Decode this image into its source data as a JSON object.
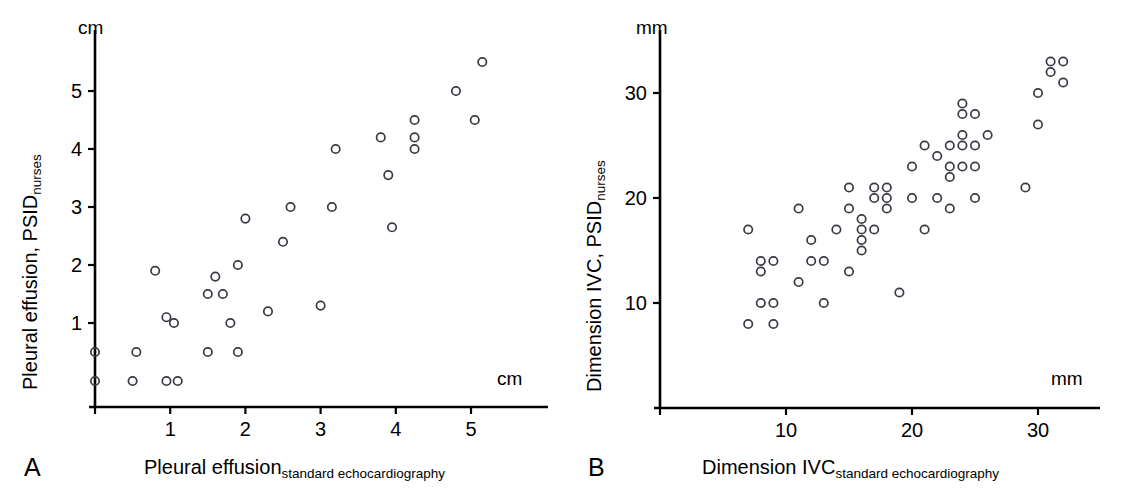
{
  "figure": {
    "background": "#ffffff",
    "marker_color": "#3a3a45",
    "axis_color": "#000000"
  },
  "panels": [
    {
      "letter": "A",
      "x_axis_unit": "cm",
      "y_axis_unit": "cm",
      "x_label_main": "Pleural effusion",
      "x_label_sub": "standard echocardiography",
      "y_label_main": "Pleural effusion, PSID",
      "y_label_sub": "nurses",
      "x_ticks": [
        1,
        2,
        3,
        4,
        5
      ],
      "y_ticks": [
        1,
        2,
        3,
        4,
        5
      ]
    },
    {
      "letter": "B",
      "x_axis_unit": "mm",
      "y_axis_unit": "mm",
      "x_label_main": "Dimension IVC",
      "x_label_sub": "standard echocardiography",
      "y_label_main": "Dimension IVC, PSID",
      "y_label_sub": "nurses",
      "x_ticks": [
        10,
        20,
        30
      ],
      "y_ticks": [
        10,
        20,
        30
      ]
    }
  ],
  "chart_data": [
    {
      "type": "scatter",
      "panel": "A",
      "title": "",
      "xlabel": "Pleural effusion (standard echocardiography)",
      "ylabel": "Pleural effusion, PSID (nurses)",
      "xunit": "cm",
      "yunit": "cm",
      "xlim": [
        0,
        5.8
      ],
      "ylim": [
        0,
        5.8
      ],
      "xticks": [
        1,
        2,
        3,
        4,
        5
      ],
      "yticks": [
        1,
        2,
        3,
        4,
        5
      ],
      "grid": false,
      "legend": "none",
      "n_points": 38,
      "points": [
        [
          0.0,
          0.0
        ],
        [
          0.0,
          0.5
        ],
        [
          0.5,
          0.0
        ],
        [
          0.95,
          0.0
        ],
        [
          1.1,
          0.0
        ],
        [
          0.55,
          0.5
        ],
        [
          1.5,
          0.5
        ],
        [
          1.9,
          0.5
        ],
        [
          0.95,
          1.1
        ],
        [
          1.05,
          1.0
        ],
        [
          1.8,
          1.0
        ],
        [
          1.5,
          1.5
        ],
        [
          1.7,
          1.5
        ],
        [
          0.8,
          1.9
        ],
        [
          1.6,
          1.8
        ],
        [
          1.9,
          2.0
        ],
        [
          2.3,
          1.2
        ],
        [
          3.0,
          1.3
        ],
        [
          2.0,
          2.8
        ],
        [
          2.5,
          2.4
        ],
        [
          2.6,
          3.0
        ],
        [
          3.15,
          3.0
        ],
        [
          3.2,
          4.0
        ],
        [
          3.8,
          4.2
        ],
        [
          3.9,
          3.55
        ],
        [
          3.95,
          2.65
        ],
        [
          4.25,
          4.5
        ],
        [
          4.25,
          4.2
        ],
        [
          4.25,
          4.0
        ],
        [
          4.8,
          5.0
        ],
        [
          5.05,
          4.5
        ],
        [
          5.15,
          5.5
        ]
      ]
    },
    {
      "type": "scatter",
      "panel": "B",
      "title": "",
      "xlabel": "Dimension IVC (standard echocardiography)",
      "ylabel": "Dimension IVC, PSID (nurses)",
      "xunit": "mm",
      "yunit": "mm",
      "xlim": [
        3,
        34
      ],
      "ylim": [
        4,
        35
      ],
      "xticks": [
        10,
        20,
        30
      ],
      "yticks": [
        10,
        20,
        30
      ],
      "grid": false,
      "legend": "none",
      "n_points": 63,
      "points": [
        [
          7.0,
          17.0
        ],
        [
          7.0,
          8.0
        ],
        [
          8.0,
          14.0
        ],
        [
          8.0,
          13.0
        ],
        [
          8.0,
          10.0
        ],
        [
          9.0,
          14.0
        ],
        [
          9.0,
          10.0
        ],
        [
          9.0,
          8.0
        ],
        [
          11.0,
          19.0
        ],
        [
          11.0,
          12.0
        ],
        [
          12.0,
          16.0
        ],
        [
          12.0,
          14.0
        ],
        [
          13.0,
          14.0
        ],
        [
          13.0,
          10.0
        ],
        [
          14.0,
          17.0
        ],
        [
          15.0,
          21.0
        ],
        [
          15.0,
          19.0
        ],
        [
          15.0,
          13.0
        ],
        [
          16.0,
          18.0
        ],
        [
          16.0,
          17.0
        ],
        [
          16.0,
          16.0
        ],
        [
          16.0,
          15.0
        ],
        [
          17.0,
          21.0
        ],
        [
          17.0,
          20.0
        ],
        [
          17.0,
          17.0
        ],
        [
          18.0,
          21.0
        ],
        [
          18.0,
          20.0
        ],
        [
          18.0,
          19.0
        ],
        [
          19.0,
          11.0
        ],
        [
          20.0,
          20.0
        ],
        [
          20.0,
          23.0
        ],
        [
          21.0,
          25.0
        ],
        [
          21.0,
          17.0
        ],
        [
          22.0,
          24.0
        ],
        [
          22.0,
          20.0
        ],
        [
          23.0,
          25.0
        ],
        [
          23.0,
          23.0
        ],
        [
          23.0,
          22.0
        ],
        [
          23.0,
          19.0
        ],
        [
          24.0,
          29.0
        ],
        [
          24.0,
          28.0
        ],
        [
          24.0,
          26.0
        ],
        [
          24.0,
          25.0
        ],
        [
          24.0,
          23.0
        ],
        [
          25.0,
          28.0
        ],
        [
          25.0,
          25.0
        ],
        [
          25.0,
          23.0
        ],
        [
          25.0,
          20.0
        ],
        [
          26.0,
          26.0
        ],
        [
          29.0,
          21.0
        ],
        [
          30.0,
          30.0
        ],
        [
          30.0,
          27.0
        ],
        [
          31.0,
          32.0
        ],
        [
          31.0,
          33.0
        ],
        [
          32.0,
          33.0
        ],
        [
          32.0,
          31.0
        ]
      ]
    }
  ]
}
